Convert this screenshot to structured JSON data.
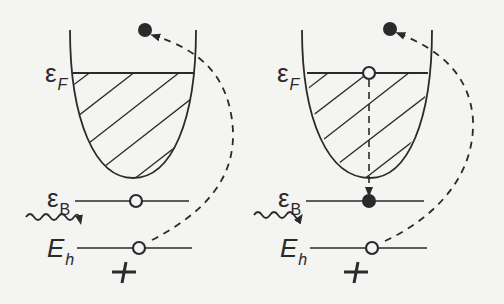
{
  "colors": {
    "background": "#f4f4f2",
    "ink": "#2a2a2a"
  },
  "panels": [
    {
      "id": "left",
      "labels": {
        "fermi": {
          "main": "ε",
          "sub": "F"
        },
        "bound": {
          "main": "ε",
          "sub": "B"
        },
        "hole": {
          "main": "E",
          "sub": "h"
        },
        "charge": "+"
      },
      "states": {
        "excited_electron": "filled",
        "fermi_level": "none",
        "bound_level": "empty",
        "hole_level": "empty"
      },
      "arrows": [
        "photon-wavy-arrow",
        "dashed-curve-hole-to-excited-electron"
      ]
    },
    {
      "id": "right",
      "labels": {
        "fermi": {
          "main": "ε",
          "sub": "F"
        },
        "bound": {
          "main": "ε",
          "sub": "B"
        },
        "hole": {
          "main": "E",
          "sub": "h"
        },
        "charge": "+"
      },
      "states": {
        "excited_electron": "filled",
        "fermi_level": "empty",
        "bound_level": "filled",
        "hole_level": "empty"
      },
      "arrows": [
        "photon-wavy-arrow",
        "dashed-curve-hole-to-excited-electron",
        "dashed-vertical-fermi-to-bound"
      ]
    }
  ]
}
